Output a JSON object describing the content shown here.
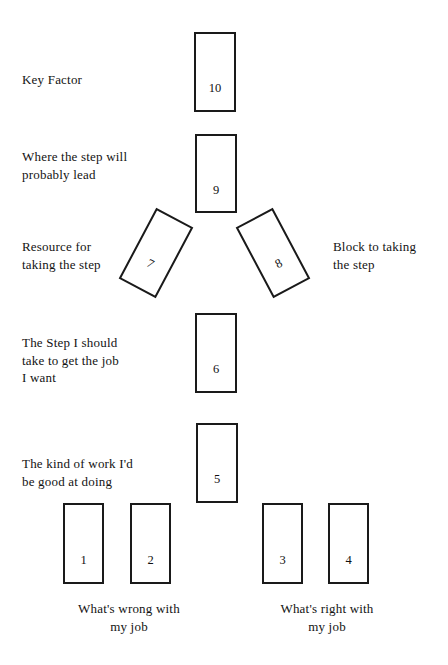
{
  "diagram": {
    "background_color": "#ffffff",
    "card_border_color": "#1a1a1a",
    "text_color": "#131313"
  },
  "cards": [
    {
      "id": "card-1",
      "number": "1",
      "x": 63,
      "y": 503,
      "width": 41,
      "height": 81,
      "rotation": 0
    },
    {
      "id": "card-2",
      "number": "2",
      "x": 130,
      "y": 503,
      "width": 41,
      "height": 81,
      "rotation": 0
    },
    {
      "id": "card-3",
      "number": "3",
      "x": 262,
      "y": 503,
      "width": 41,
      "height": 81,
      "rotation": 0
    },
    {
      "id": "card-4",
      "number": "4",
      "x": 328,
      "y": 503,
      "width": 41,
      "height": 81,
      "rotation": 0
    },
    {
      "id": "card-5",
      "number": "5",
      "x": 196,
      "y": 423,
      "width": 42,
      "height": 80,
      "rotation": 0
    },
    {
      "id": "card-6",
      "number": "6",
      "x": 195,
      "y": 313,
      "width": 42,
      "height": 80,
      "rotation": 0
    },
    {
      "id": "card-7",
      "number": "7",
      "x": 135,
      "y": 213,
      "width": 42,
      "height": 80,
      "rotation": 28
    },
    {
      "id": "card-8",
      "number": "8",
      "x": 252,
      "y": 213,
      "width": 42,
      "height": 80,
      "rotation": -28
    },
    {
      "id": "card-9",
      "number": "9",
      "x": 195,
      "y": 134,
      "width": 42,
      "height": 79,
      "rotation": 0
    },
    {
      "id": "card-10",
      "number": "10",
      "x": 194,
      "y": 32,
      "width": 42,
      "height": 80,
      "rotation": 0
    }
  ],
  "labels": [
    {
      "id": "label-key-factor",
      "text": "Key Factor",
      "x": 22,
      "y": 71,
      "align": "left"
    },
    {
      "id": "label-where-step-leads",
      "text": "Where the step will\nprobably lead",
      "x": 22,
      "y": 148,
      "align": "left"
    },
    {
      "id": "label-resource",
      "text": "Resource for\ntaking the step",
      "x": 22,
      "y": 238,
      "align": "left"
    },
    {
      "id": "label-block",
      "text": "Block to taking\nthe step",
      "x": 333,
      "y": 238,
      "align": "left"
    },
    {
      "id": "label-the-step",
      "text": "The Step I should\ntake to get the job\nI want",
      "x": 22,
      "y": 334,
      "align": "left"
    },
    {
      "id": "label-kind-of-work",
      "text": "The kind of work I'd\nbe good at doing",
      "x": 22,
      "y": 455,
      "align": "left"
    }
  ],
  "captions": [
    {
      "id": "caption-whats-wrong",
      "text": "What's wrong with\nmy job",
      "x": 49,
      "y": 600,
      "width": 160
    },
    {
      "id": "caption-whats-right",
      "text": "What's right with\nmy job",
      "x": 247,
      "y": 600,
      "width": 160
    }
  ]
}
